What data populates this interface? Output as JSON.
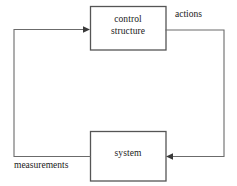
{
  "diagram": {
    "type": "control-feedback-loop",
    "nodes": [
      {
        "id": "control-structure",
        "label": "control\nstructure",
        "x": 90,
        "y": 6,
        "width": 76,
        "height": 44
      },
      {
        "id": "system",
        "label": "system",
        "x": 90,
        "y": 131,
        "width": 76,
        "height": 50
      }
    ],
    "edges": [
      {
        "id": "actions-edge",
        "label": "actions",
        "from": "control-structure",
        "to": "system",
        "direction": "clockwise-right"
      },
      {
        "id": "measurements-edge",
        "label": "measurements",
        "from": "system",
        "to": "control-structure",
        "direction": "counterclockwise-left"
      }
    ],
    "colors": {
      "box_stroke": "#555555",
      "line_stroke": "#6b6b6b",
      "arrow_fill": "#3a3a3a",
      "text": "#1a1a1a",
      "background": "#ffffff"
    }
  }
}
